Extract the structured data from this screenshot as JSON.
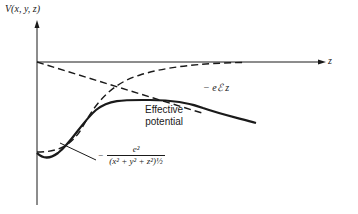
{
  "figure": {
    "y_axis_label": "V(x, y, z)",
    "z_axis_label": "z",
    "field_term_label": "− eℰ z",
    "effective_potential_label": [
      "Effective",
      "potential"
    ],
    "coulomb_term": {
      "minus": "−",
      "numerator": "e²",
      "denominator": "(x² + y² + z²)½"
    }
  },
  "curves": [
    {
      "name": "coulomb-potential",
      "style": "dashed",
      "description": "rises from deep minimum at origin toward zero"
    },
    {
      "name": "field-potential",
      "style": "dashed",
      "description": "straight line −eℰz decreasing linearly with z"
    },
    {
      "name": "effective-potential",
      "style": "solid",
      "description": "sum of Coulomb and field terms; has a barrier maximum then decreases"
    }
  ],
  "colors": {
    "line": "#1a1a1a",
    "background": "#ffffff"
  }
}
